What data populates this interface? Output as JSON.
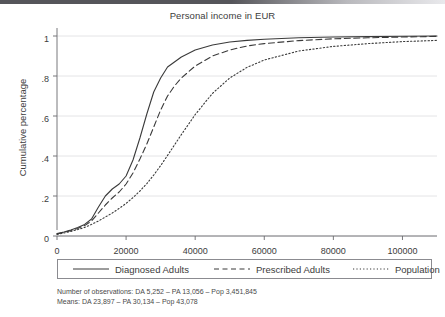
{
  "chart_data": {
    "type": "line",
    "title": "Personal income in EUR",
    "xlabel": "",
    "ylabel": "Cumulative percentage",
    "xlim": [
      0,
      110000
    ],
    "ylim": [
      0,
      1.04
    ],
    "xticks": [
      0,
      20000,
      40000,
      60000,
      80000,
      100000
    ],
    "xticklabels": [
      "0",
      "20000",
      "40000",
      "60000",
      "80000",
      "100000"
    ],
    "yticks": [
      0,
      0.2,
      0.4,
      0.6,
      0.8,
      1
    ],
    "yticklabels": [
      "0",
      ".2",
      ".4",
      ".6",
      ".8",
      "1"
    ],
    "grid": "horizontal",
    "legend_position": "below-plot",
    "series": [
      {
        "name": "Diagnosed Adults",
        "style": "solid",
        "color": "#3a3a3a",
        "x": [
          0,
          2000,
          4000,
          6000,
          8000,
          10000,
          12000,
          14000,
          16000,
          18000,
          20000,
          22000,
          24000,
          26000,
          28000,
          30000,
          32000,
          34000,
          36000,
          40000,
          45000,
          50000,
          55000,
          60000,
          70000,
          80000,
          90000,
          100000,
          110000
        ],
        "y": [
          0.012,
          0.02,
          0.03,
          0.042,
          0.058,
          0.085,
          0.145,
          0.2,
          0.235,
          0.26,
          0.3,
          0.38,
          0.49,
          0.61,
          0.72,
          0.79,
          0.845,
          0.87,
          0.895,
          0.93,
          0.955,
          0.97,
          0.978,
          0.984,
          0.991,
          0.995,
          0.997,
          0.999,
          1.0
        ]
      },
      {
        "name": "Prescribed Adults",
        "style": "dashed",
        "color": "#3a3a3a",
        "x": [
          0,
          2000,
          4000,
          6000,
          8000,
          10000,
          12000,
          14000,
          16000,
          18000,
          20000,
          22000,
          24000,
          26000,
          28000,
          30000,
          32000,
          34000,
          36000,
          40000,
          45000,
          50000,
          55000,
          60000,
          70000,
          80000,
          90000,
          100000,
          110000
        ],
        "y": [
          0.01,
          0.018,
          0.027,
          0.038,
          0.052,
          0.075,
          0.115,
          0.155,
          0.19,
          0.22,
          0.26,
          0.315,
          0.385,
          0.46,
          0.545,
          0.63,
          0.7,
          0.75,
          0.79,
          0.85,
          0.9,
          0.93,
          0.95,
          0.962,
          0.977,
          0.986,
          0.991,
          0.995,
          0.998
        ]
      },
      {
        "name": "Population",
        "style": "dotted",
        "color": "#3a3a3a",
        "x": [
          0,
          2000,
          4000,
          6000,
          8000,
          10000,
          12000,
          14000,
          16000,
          18000,
          20000,
          22000,
          24000,
          26000,
          28000,
          30000,
          32000,
          34000,
          36000,
          40000,
          45000,
          50000,
          55000,
          60000,
          70000,
          80000,
          90000,
          100000,
          110000
        ],
        "y": [
          0.008,
          0.015,
          0.023,
          0.032,
          0.043,
          0.058,
          0.075,
          0.095,
          0.115,
          0.138,
          0.163,
          0.192,
          0.225,
          0.262,
          0.305,
          0.352,
          0.403,
          0.455,
          0.507,
          0.607,
          0.713,
          0.79,
          0.843,
          0.88,
          0.925,
          0.948,
          0.962,
          0.972,
          0.978
        ]
      }
    ],
    "footnotes": [
      "Number of observations: DA 5,252 – PA 13,056 – Pop 3,451,845",
      "Means: DA 23,897 – PA 30,134 – Pop 43,078"
    ]
  },
  "legend": {
    "items": [
      {
        "label": "Diagnosed Adults",
        "style": "solid"
      },
      {
        "label": "Prescribed Adults",
        "style": "dashed"
      },
      {
        "label": "Population",
        "style": "dotted"
      }
    ]
  },
  "colors": {
    "line": "#3a3a3a",
    "grid": "#e4e4e6",
    "axis": "#6a6a6e",
    "text": "#3c3c3c",
    "top_bar": "#55555a"
  }
}
